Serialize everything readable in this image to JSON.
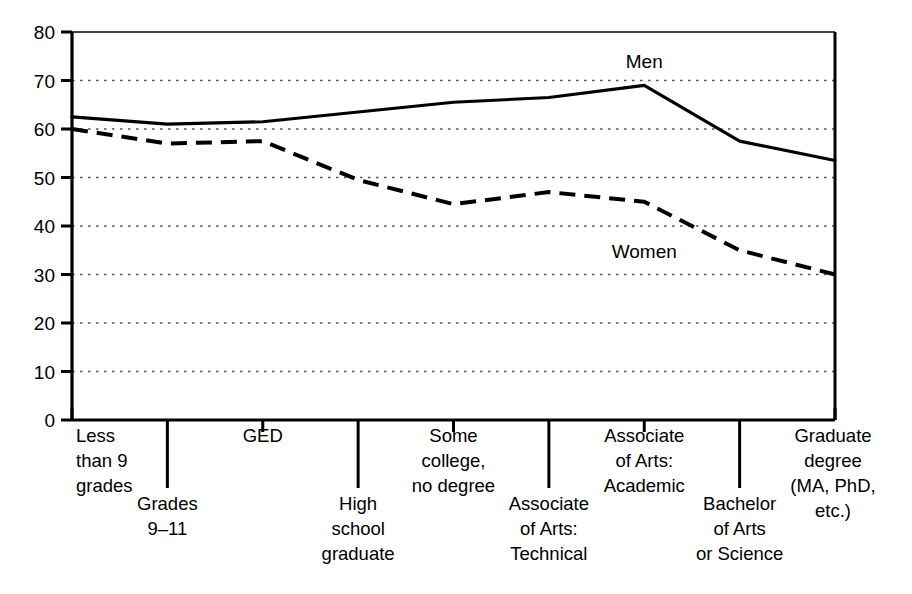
{
  "chart_data": {
    "type": "line",
    "title": "",
    "subtitle": "",
    "xlabel": "",
    "ylabel": "",
    "ylim": [
      0,
      80
    ],
    "ytick_step": 10,
    "yticks": [
      "0",
      "10",
      "20",
      "30",
      "40",
      "50",
      "60",
      "70",
      "80"
    ],
    "grid": "horizontal-dotted",
    "legend_position": "inline-annotations",
    "categories": [
      "Less than 9 grades",
      "Grades 9–11",
      "GED",
      "High school graduate",
      "Some college, no degree",
      "Associate of Arts: Technical",
      "Associate of Arts: Academic",
      "Bachelor of Arts or Science",
      "Graduate degree (MA, PhD, etc.)"
    ],
    "category_lines": [
      [
        "Less",
        "than 9",
        "grades"
      ],
      [
        "Grades",
        "9–11"
      ],
      [
        "GED"
      ],
      [
        "High",
        "school",
        "graduate"
      ],
      [
        "Some",
        "college,",
        "no degree"
      ],
      [
        "Associate",
        "of Arts:",
        "Technical"
      ],
      [
        "Associate",
        "of Arts:",
        "Academic"
      ],
      [
        "Bachelor",
        "of Arts",
        "or Science"
      ],
      [
        "Graduate",
        "degree",
        "(MA, PhD,",
        "etc.)"
      ]
    ],
    "series": [
      {
        "name": "Men",
        "style": "solid",
        "values": [
          62.5,
          61,
          61.5,
          63.5,
          65.5,
          66.5,
          69,
          57.5,
          53.5
        ]
      },
      {
        "name": "Women",
        "style": "dashed",
        "values": [
          60,
          57,
          57.5,
          49.5,
          44.5,
          47,
          45,
          35,
          30
        ]
      }
    ],
    "annotations": [
      {
        "text": "Men",
        "x_value": 6,
        "y_value": 72.5
      },
      {
        "text": "Women",
        "x_value": 6,
        "y_value": 33.5
      }
    ],
    "colors": {
      "line": "#000000",
      "axis": "#000000",
      "grid": "#555555",
      "background": "#ffffff"
    }
  }
}
